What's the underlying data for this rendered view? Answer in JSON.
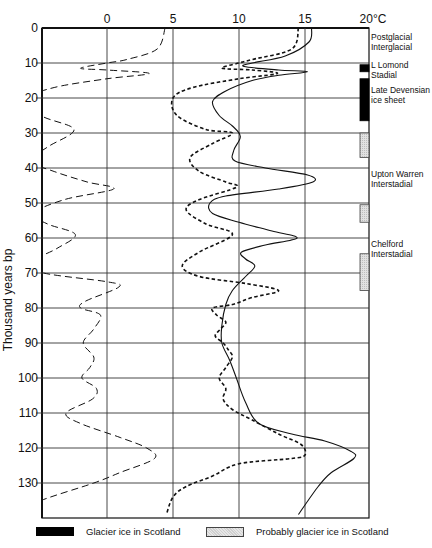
{
  "chart_data": {
    "type": "line",
    "title": "",
    "xlabel": "°C",
    "ylabel": "Thousand years bp",
    "x_ticks": [
      "0",
      "5",
      "10",
      "15",
      "20°C"
    ],
    "y_ticks": [
      "0",
      "10",
      "20",
      "30",
      "40",
      "50",
      "60",
      "70",
      "80",
      "90",
      "100",
      "110",
      "120",
      "130"
    ],
    "xlim": [
      -6.5,
      20
    ],
    "ylim": [
      0,
      140
    ],
    "y_inverted": true,
    "grid": true,
    "series": [
      {
        "name": "Long-dash curve (left)",
        "style": "long-dash",
        "points": [
          [
            4.4,
            0
          ],
          [
            3.8,
            6
          ],
          [
            1.5,
            9
          ],
          [
            0,
            10
          ],
          [
            -2,
            11.5
          ],
          [
            0,
            12
          ],
          [
            3.2,
            13
          ],
          [
            0,
            14.5
          ],
          [
            -4,
            17
          ],
          [
            -5.8,
            20
          ],
          [
            -5,
            25
          ],
          [
            -2.5,
            29
          ],
          [
            -4.5,
            34
          ],
          [
            -5.8,
            38
          ],
          [
            -4,
            41
          ],
          [
            -1.5,
            44
          ],
          [
            0.5,
            46
          ],
          [
            -3.2,
            49
          ],
          [
            -5.6,
            53
          ],
          [
            -4.5,
            56
          ],
          [
            -2.4,
            59
          ],
          [
            -3.8,
            63
          ],
          [
            -5.8,
            67
          ],
          [
            -4.8,
            70
          ],
          [
            0,
            72.5
          ],
          [
            0.9,
            74
          ],
          [
            -1.6,
            78
          ],
          [
            -2,
            80
          ],
          [
            -0.5,
            82
          ],
          [
            -1,
            86
          ],
          [
            -1.8,
            90
          ],
          [
            -1,
            94
          ],
          [
            -1.3,
            97
          ],
          [
            -1.9,
            100
          ],
          [
            -0.8,
            103
          ],
          [
            -1.1,
            106
          ],
          [
            -3.1,
            110
          ],
          [
            -2,
            113
          ],
          [
            1,
            117
          ],
          [
            3,
            120
          ],
          [
            3.6,
            123
          ],
          [
            1,
            127
          ],
          [
            -1,
            130
          ],
          [
            -5,
            135
          ],
          [
            -7,
            139
          ]
        ]
      },
      {
        "name": "Short-dash curve (middle)",
        "style": "short-dash",
        "points": [
          [
            14.5,
            0
          ],
          [
            14,
            6
          ],
          [
            11,
            9
          ],
          [
            10,
            10
          ],
          [
            8.7,
            11.5
          ],
          [
            11,
            12
          ],
          [
            12.9,
            13
          ],
          [
            10,
            14.5
          ],
          [
            6.5,
            17
          ],
          [
            5,
            20
          ],
          [
            5.3,
            25
          ],
          [
            7.5,
            29
          ],
          [
            9.5,
            30
          ],
          [
            8,
            33
          ],
          [
            6.3,
            37
          ],
          [
            7,
            41
          ],
          [
            9,
            44
          ],
          [
            9.8,
            45.5
          ],
          [
            7,
            49
          ],
          [
            6,
            52
          ],
          [
            7.5,
            56
          ],
          [
            9.5,
            59
          ],
          [
            7,
            64
          ],
          [
            5.7,
            68
          ],
          [
            7,
            71
          ],
          [
            10.5,
            73
          ],
          [
            13,
            75
          ],
          [
            11,
            77
          ],
          [
            9.5,
            79
          ],
          [
            8,
            80
          ],
          [
            8.3,
            82
          ],
          [
            9,
            84
          ],
          [
            8.6,
            86
          ],
          [
            8.2,
            88
          ],
          [
            8.8,
            90
          ],
          [
            9.2,
            92
          ],
          [
            9.5,
            94
          ],
          [
            9,
            97
          ],
          [
            8.5,
            100
          ],
          [
            9,
            103
          ],
          [
            8.8,
            106
          ],
          [
            9.5,
            109
          ],
          [
            11,
            112
          ],
          [
            13,
            116
          ],
          [
            14.7,
            119
          ],
          [
            15,
            122
          ],
          [
            14,
            123
          ],
          [
            10,
            124.5
          ],
          [
            8,
            128
          ],
          [
            6,
            131
          ],
          [
            5,
            134
          ],
          [
            4.5,
            139
          ]
        ]
      },
      {
        "name": "Solid curve (temperature)",
        "style": "solid",
        "points": [
          [
            15.5,
            0
          ],
          [
            15.3,
            4
          ],
          [
            13.5,
            8
          ],
          [
            11,
            10
          ],
          [
            10.4,
            11
          ],
          [
            13,
            12
          ],
          [
            15.2,
            12.5
          ],
          [
            13,
            13.5
          ],
          [
            11,
            15
          ],
          [
            9,
            18
          ],
          [
            8,
            21
          ],
          [
            8.5,
            25
          ],
          [
            9.5,
            28
          ],
          [
            10.1,
            31
          ],
          [
            9.6,
            35
          ],
          [
            9.7,
            38
          ],
          [
            12,
            40
          ],
          [
            15.2,
            42
          ],
          [
            15.6,
            44
          ],
          [
            13,
            46
          ],
          [
            9,
            48
          ],
          [
            7.8,
            50
          ],
          [
            8,
            53
          ],
          [
            10,
            55.5
          ],
          [
            12.5,
            58
          ],
          [
            14.4,
            60
          ],
          [
            12,
            62
          ],
          [
            10.2,
            64
          ],
          [
            10.5,
            66
          ],
          [
            11.2,
            68
          ],
          [
            10.5,
            71
          ],
          [
            9.5,
            75
          ],
          [
            9,
            79
          ],
          [
            8.7,
            85
          ],
          [
            8.7,
            90
          ],
          [
            9.3,
            95
          ],
          [
            9.8,
            100
          ],
          [
            10.5,
            107
          ],
          [
            11.5,
            113
          ],
          [
            14,
            116
          ],
          [
            16.5,
            118
          ],
          [
            18.5,
            121
          ],
          [
            18.7,
            123
          ],
          [
            17,
            127
          ],
          [
            16,
            131
          ],
          [
            14.5,
            139
          ]
        ]
      }
    ],
    "periods": [
      {
        "label_lines": [
          "Postglacial",
          "Interglacial"
        ],
        "y": 4
      },
      {
        "label_lines": [
          "L Lomond",
          "Stadial"
        ],
        "y": 12
      },
      {
        "label_lines": [
          "Late Devensian",
          "ice sheet"
        ],
        "y": 19
      },
      {
        "label_lines": [
          "Upton Warren",
          "Interstadial"
        ],
        "y": 43
      },
      {
        "label_lines": [
          "Chelford",
          "Interstadial"
        ],
        "y": 63
      }
    ],
    "ice_bars": [
      {
        "type": "glacier",
        "from": 10.5,
        "to": 12.5
      },
      {
        "type": "glacier",
        "from": 14.5,
        "to": 26.5
      },
      {
        "type": "probable",
        "from": 30,
        "to": 37
      },
      {
        "type": "probable",
        "from": 50.5,
        "to": 55.5
      },
      {
        "type": "probable",
        "from": 64.5,
        "to": 75
      }
    ],
    "legend": [
      {
        "label": "Glacier ice in Scotland",
        "swatch": "solid-black"
      },
      {
        "label": "Probably glacier ice in Scotland",
        "swatch": "stippled"
      }
    ]
  },
  "legend": {
    "glacier": "Glacier ice in Scotland",
    "probable": "Probably glacier ice in Scotland"
  }
}
